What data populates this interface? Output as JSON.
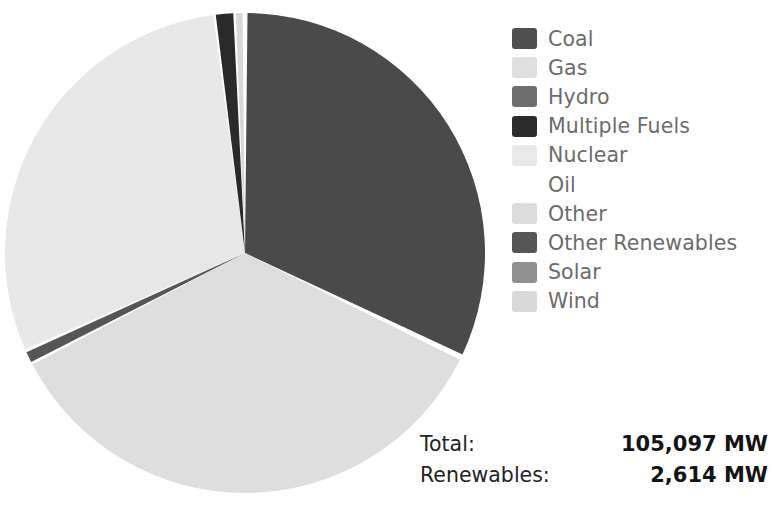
{
  "chart_data": {
    "type": "pie",
    "title": "",
    "unit": "MW",
    "legend_position": "right",
    "categories": [
      "Coal",
      "Gas",
      "Hydro",
      "Multiple Fuels",
      "Nuclear",
      "Oil",
      "Other",
      "Other Renewables",
      "Solar",
      "Wind"
    ],
    "colors": [
      "#4a4a4a",
      "#dedede",
      "#6e6e6e",
      "#2a2a2a",
      "#e8e8e8",
      "#ffffff",
      "#dcdcdc",
      "#565656",
      "#909090",
      "#d8d8d8"
    ],
    "values": [
      33550,
      36750,
      820,
      170,
      30900,
      60,
      250,
      340,
      140,
      1117
    ],
    "slices": [
      {
        "label": "Coal",
        "color": "#4a4a4a",
        "start_angle": 0.6,
        "end_angle": 115.0
      },
      {
        "label": "Gas",
        "color": "#dedede",
        "start_angle": 116.4,
        "end_angle": 242.3
      },
      {
        "label": "Other Renewables",
        "color": "#565656",
        "start_angle": 243.0,
        "end_angle": 245.6
      },
      {
        "label": "Nuclear",
        "color": "#e8e8e8",
        "start_angle": 246.3,
        "end_angle": 352.4
      },
      {
        "label": "Multiple Fuels",
        "color": "#2a2a2a",
        "start_angle": 353.0,
        "end_angle": 357.2
      },
      {
        "label": "Wind",
        "color": "#d8d8d8",
        "start_angle": 357.8,
        "end_angle": 359.4
      }
    ],
    "center_x": 245,
    "center_y": 253,
    "radius": 240,
    "separator_color": "#ffffff"
  },
  "legend": {
    "items": [
      {
        "label": "Coal",
        "color": "#4f4f4f"
      },
      {
        "label": "Gas",
        "color": "#e0e0e0"
      },
      {
        "label": "Hydro",
        "color": "#6e6e6e"
      },
      {
        "label": "Multiple Fuels",
        "color": "#2c2c2c"
      },
      {
        "label": "Nuclear",
        "color": "#e9e9e9"
      },
      {
        "label": "Oil",
        "color": "#ffffff"
      },
      {
        "label": "Other",
        "color": "#dcdcdc"
      },
      {
        "label": "Other Renewables",
        "color": "#565656"
      },
      {
        "label": "Solar",
        "color": "#909090"
      },
      {
        "label": "Wind",
        "color": "#d9d9d9"
      }
    ]
  },
  "totals": {
    "rows": [
      {
        "label": "Total:",
        "value": "105,097 MW"
      },
      {
        "label": "Renewables:",
        "value": "2,614 MW"
      }
    ]
  }
}
